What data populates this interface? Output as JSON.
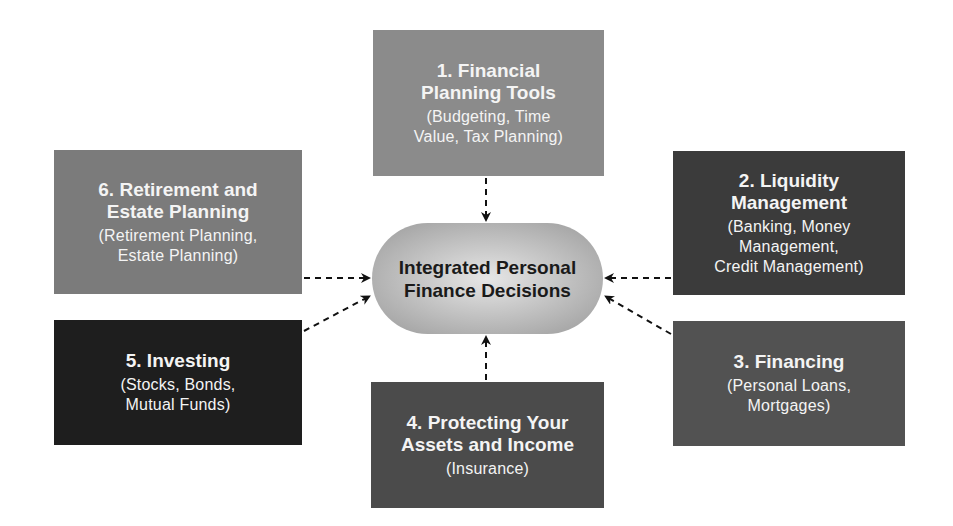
{
  "center": {
    "line1": "Integrated Personal",
    "line2": "Finance Decisions"
  },
  "nodes": [
    {
      "id": 1,
      "title_line1": "1. Financial",
      "title_line2": "Planning Tools",
      "sub_line1": "(Budgeting, Time",
      "sub_line2": "Value, Tax Planning)",
      "color": "#8b8b8b"
    },
    {
      "id": 2,
      "title_line1": "2. Liquidity",
      "title_line2": "Management",
      "sub_line1": "(Banking, Money",
      "sub_line2": "Management,",
      "sub_line3": "Credit Management)",
      "color": "#3b3b3b"
    },
    {
      "id": 3,
      "title_line1": "3. Financing",
      "sub_line1": "(Personal Loans,",
      "sub_line2": "Mortgages)",
      "color": "#525252"
    },
    {
      "id": 4,
      "title_line1": "4. Protecting Your",
      "title_line2": "Assets and Income",
      "sub_line1": "(Insurance)",
      "color": "#4b4b4b"
    },
    {
      "id": 5,
      "title_line1": "5. Investing",
      "sub_line1": "(Stocks, Bonds,",
      "sub_line2": "Mutual Funds)",
      "color": "#1e1e1e"
    },
    {
      "id": 6,
      "title_line1": "6. Retirement and",
      "title_line2": "Estate Planning",
      "sub_line1": "(Retirement Planning,",
      "sub_line2": "Estate Planning)",
      "color": "#7b7b7b"
    }
  ],
  "edges": [
    {
      "from": 1,
      "to": "center",
      "style": "dashed-arrow"
    },
    {
      "from": 2,
      "to": "center",
      "style": "dashed-arrow"
    },
    {
      "from": 3,
      "to": "center",
      "style": "dashed-arrow"
    },
    {
      "from": 4,
      "to": "center",
      "style": "dashed-arrow"
    },
    {
      "from": 5,
      "to": "center",
      "style": "dashed-arrow"
    },
    {
      "from": 6,
      "to": "center",
      "style": "dashed-arrow"
    }
  ]
}
